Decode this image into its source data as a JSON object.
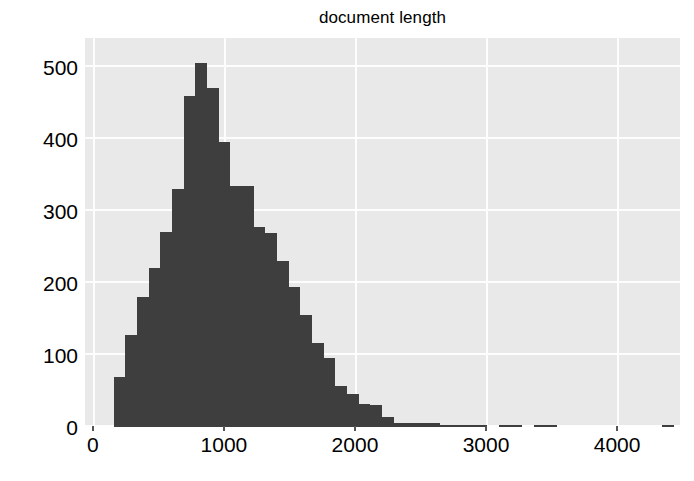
{
  "chart_data": {
    "type": "bar",
    "title": "document length",
    "xlabel": "",
    "ylabel": "",
    "xlim": [
      -60,
      4480
    ],
    "ylim": [
      0,
      540
    ],
    "xticks": [
      0,
      1000,
      2000,
      3000,
      4000
    ],
    "yticks": [
      0,
      100,
      200,
      300,
      400,
      500
    ],
    "xtick_labels": [
      "0",
      "1000",
      "2000",
      "3000",
      "4000"
    ],
    "ytick_labels": [
      "0",
      "100",
      "200",
      "300",
      "400",
      "500"
    ],
    "grid": true,
    "legend": null,
    "bar_color": "#3e3e3e",
    "plot_background": "#e9e9e9",
    "figure_background": "#ffffff",
    "bin_width": 89,
    "bin_left_edges": [
      160,
      249,
      338,
      427,
      516,
      605,
      694,
      783,
      872,
      961,
      1050,
      1139,
      1228,
      1317,
      1406,
      1495,
      1584,
      1673,
      1762,
      1851,
      1940,
      2029,
      2118,
      2207,
      2296,
      2385,
      2474,
      2563,
      2652,
      2741,
      2830,
      2919,
      3008,
      3097,
      3186,
      3275,
      3364,
      3453,
      3542,
      3631,
      3720,
      3809,
      3898,
      3987,
      4076,
      4165,
      4254,
      4343
    ],
    "values": [
      70,
      128,
      180,
      221,
      271,
      330,
      460,
      505,
      470,
      395,
      335,
      335,
      277,
      270,
      230,
      195,
      156,
      117,
      96,
      57,
      46,
      32,
      30,
      14,
      6,
      6,
      5,
      5,
      1,
      1,
      1,
      1,
      0,
      1,
      1,
      0,
      1,
      1,
      0,
      0,
      0,
      0,
      0,
      0,
      0,
      0,
      0,
      1
    ],
    "peak_value": 505,
    "peak_bin_center": 827
  }
}
